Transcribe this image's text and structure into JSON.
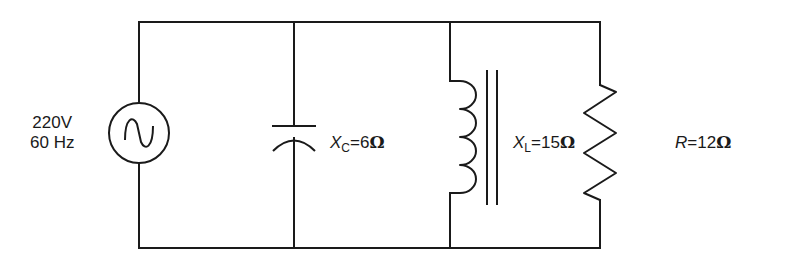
{
  "diagram": {
    "source": {
      "voltage": "220V",
      "frequency": "60 Hz",
      "icon": "ac-source-icon"
    },
    "capacitor": {
      "symbol": "X",
      "subscript": "C",
      "equals": "=",
      "value": "6",
      "unit": "Ω",
      "icon": "capacitor-icon"
    },
    "inductor": {
      "symbol": "X",
      "subscript": "L",
      "equals": "=",
      "value": "15",
      "unit": "Ω",
      "icon": "inductor-iron-core-icon"
    },
    "resistor": {
      "symbol": "R",
      "equals": "=",
      "value": "12",
      "unit": "Ω",
      "icon": "resistor-icon"
    },
    "colors": {
      "line": "#1a1a1a",
      "background": "#ffffff"
    }
  }
}
